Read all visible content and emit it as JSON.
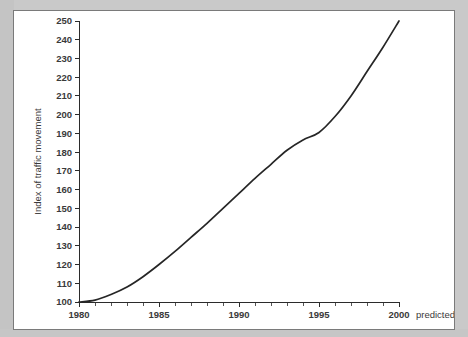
{
  "panel": {
    "background_color": "#ffffff",
    "border_color": "#7a7a7a",
    "page_background_color": "#c9c9c9"
  },
  "chart_data": {
    "type": "line",
    "title": "",
    "subtitle": "",
    "xlabel": "Year",
    "ylabel": "Index of traffic movement",
    "xlim": [
      1980,
      2000
    ],
    "ylim": [
      100,
      250
    ],
    "grid": false,
    "legend": null,
    "line_color": "#262626",
    "annotations": [
      {
        "text": "predicted",
        "x": 2000,
        "position": "right-of-axis-end"
      }
    ],
    "x_tick_labels": [
      "1980",
      "1985",
      "1990",
      "1995",
      "2000"
    ],
    "x_tick_values": [
      1980,
      1985,
      1990,
      1995,
      2000
    ],
    "x_minor_tick_values": [
      1981,
      1982,
      1983,
      1984,
      1986,
      1987,
      1988,
      1989,
      1991,
      1992,
      1993,
      1994,
      1996,
      1997,
      1998,
      1999
    ],
    "y_tick_labels": [
      "100",
      "110",
      "120",
      "130",
      "140",
      "150",
      "160",
      "170",
      "180",
      "190",
      "200",
      "210",
      "220",
      "230",
      "240",
      "250"
    ],
    "y_tick_values": [
      100,
      110,
      120,
      130,
      140,
      150,
      160,
      170,
      180,
      190,
      200,
      210,
      220,
      230,
      240,
      250
    ],
    "x": [
      1980,
      1981,
      1982,
      1983,
      1984,
      1985,
      1986,
      1987,
      1988,
      1989,
      1990,
      1991,
      1992,
      1993,
      1994,
      1995,
      1996,
      1997,
      1998,
      1999,
      2000
    ],
    "values": [
      100,
      101,
      104,
      108,
      113.5,
      120,
      127,
      134.5,
      142,
      150,
      158,
      166,
      173.5,
      181,
      186.5,
      190.5,
      199,
      210,
      223,
      236,
      250
    ],
    "series": [
      {
        "name": "Index of traffic movement",
        "values": [
          100,
          101,
          104,
          108,
          113.5,
          120,
          127,
          134.5,
          142,
          150,
          158,
          166,
          173.5,
          181,
          186.5,
          190.5,
          199,
          210,
          223,
          236,
          250
        ]
      }
    ]
  }
}
